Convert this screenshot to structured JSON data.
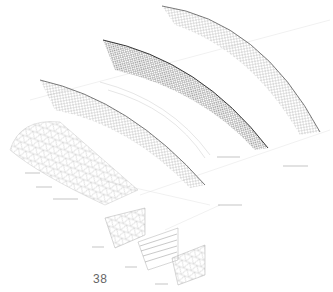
{
  "diagram": {
    "type": "exploded axonometric of wireframe shell structure",
    "layers": [
      {
        "id": "shell-top",
        "description": "outer curved mesh shell"
      },
      {
        "id": "shell-dense",
        "description": "dense diagrid mesh shell"
      },
      {
        "id": "ribs",
        "description": "segmented rib band"
      },
      {
        "id": "shell-lower",
        "description": "lower curved mesh shell"
      },
      {
        "id": "triangulated-panel",
        "description": "triangulated panel mesh"
      },
      {
        "id": "detail-panels",
        "description": "three exploded detail panels"
      }
    ],
    "annotations_legible": false
  },
  "page": {
    "number": "38"
  }
}
